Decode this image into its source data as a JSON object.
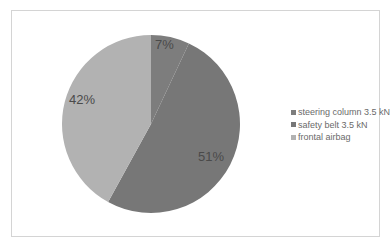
{
  "chart_data": {
    "type": "pie",
    "title": "",
    "categories": [
      "steering column 3.5 kN",
      "safety belt 3.5 kN",
      "frontal airbag"
    ],
    "values": [
      7,
      51,
      42
    ],
    "labels": [
      "7%",
      "51%",
      "42%"
    ],
    "colors": [
      "#7d7d7d",
      "#777777",
      "#b2b2b2"
    ],
    "start_angle": "12 o'clock, clockwise",
    "legend_position": "right"
  },
  "legend": {
    "items": [
      {
        "label": "steering column 3.5 kN",
        "color": "#7d7d7d"
      },
      {
        "label": "safety belt 3.5 kN",
        "color": "#777777"
      },
      {
        "label": "frontal airbag",
        "color": "#b2b2b2"
      }
    ]
  }
}
